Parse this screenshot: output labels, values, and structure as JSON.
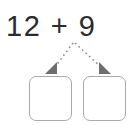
{
  "problem": {
    "equation": "12 + 9",
    "first_addend": "12",
    "operator": "+",
    "second_addend": "9"
  },
  "decomposition": {
    "arrow_style": "dotted",
    "arrow_count": 2,
    "arrow_color": "#8c8c8c",
    "boxes": [
      {
        "name": "left-box",
        "value": ""
      },
      {
        "name": "right-box",
        "value": ""
      }
    ]
  },
  "colors": {
    "background": "#ffffff",
    "text": "#2b2b2b",
    "box_border": "#a9a9a9",
    "arrow": "#8c8c8c"
  }
}
